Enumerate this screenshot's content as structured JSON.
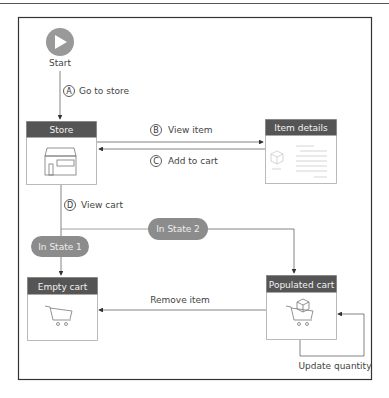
{
  "diagram": {
    "start": {
      "label": "Start"
    },
    "nodes": {
      "store": {
        "title": "Store",
        "icon": "storefront-icon"
      },
      "item_details": {
        "title": "Item details",
        "icon": "product-page-icon"
      },
      "empty_cart": {
        "title": "Empty cart",
        "icon": "empty-cart-icon"
      },
      "populated_cart": {
        "title": "Populated cart",
        "icon": "cart-with-box-icon"
      }
    },
    "states": {
      "state1": "In State 1",
      "state2": "In State 2"
    },
    "transitions": {
      "a": {
        "marker": "A",
        "label": "Go to store"
      },
      "b": {
        "marker": "B",
        "label": "View item"
      },
      "c": {
        "marker": "C",
        "label": "Add to cart"
      },
      "d": {
        "marker": "D",
        "label": "View cart"
      },
      "remove": {
        "label": "Remove item"
      },
      "update": {
        "label": "Update quantity"
      }
    },
    "colors": {
      "header_fill": "#555555",
      "pill_fill": "#8c8c8c",
      "start_fill": "#999999",
      "line": "#555555",
      "frame": "#333333"
    }
  }
}
